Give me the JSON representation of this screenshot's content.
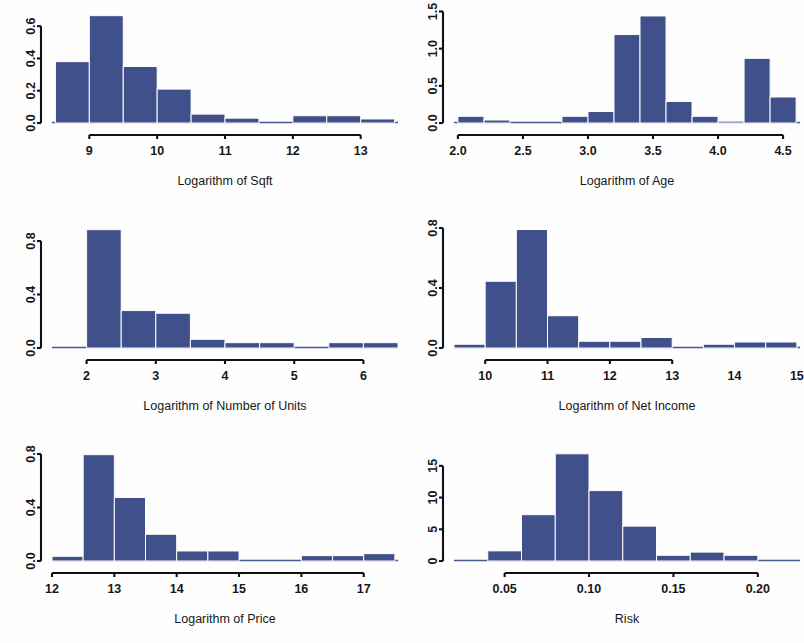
{
  "figure": {
    "background_color": "#fefefe",
    "bar_color": "#40508a",
    "axis_color": "#111111",
    "layout": "2 columns x 3 rows of histogram panels",
    "panel_count": 6
  },
  "chart_data": [
    {
      "id": "log-sqft",
      "type": "bar",
      "subtype": "histogram",
      "title": "",
      "xlabel": "Logarithm of Sqft",
      "ylabel": "",
      "grid": false,
      "legend": null,
      "xlim": [
        8.45,
        13.55
      ],
      "ylim": [
        0.0,
        0.7
      ],
      "xticks": [
        9,
        10,
        11,
        12,
        13
      ],
      "xtick_labels": [
        "9",
        "10",
        "11",
        "12",
        "13"
      ],
      "yticks": [
        0.0,
        0.2,
        0.4,
        0.6
      ],
      "ytick_labels": [
        "0.0",
        "0.2",
        "0.4",
        "0.6"
      ],
      "axis_span_x": [
        9,
        13
      ],
      "bin_width": 0.5,
      "bin_edges": [
        8.5,
        9.0,
        9.5,
        10.0,
        10.5,
        11.0,
        11.5,
        12.0,
        12.5,
        13.0,
        13.5
      ],
      "bin_centers": [
        8.75,
        9.25,
        9.75,
        10.25,
        10.75,
        11.25,
        11.75,
        12.25,
        12.75,
        13.25
      ],
      "values": [
        0.38,
        0.665,
        0.35,
        0.21,
        0.055,
        0.03,
        0.0,
        0.045,
        0.045,
        0.025
      ]
    },
    {
      "id": "log-age",
      "type": "bar",
      "subtype": "histogram",
      "title": "",
      "xlabel": "Logarithm of Age",
      "ylabel": "",
      "grid": false,
      "legend": null,
      "xlim": [
        1.97,
        4.63
      ],
      "ylim": [
        0.0,
        1.52
      ],
      "xticks": [
        2.0,
        2.5,
        3.0,
        3.5,
        4.0,
        4.5
      ],
      "xtick_labels": [
        "2.0",
        "2.5",
        "3.0",
        "3.5",
        "4.0",
        "4.5"
      ],
      "yticks": [
        0.0,
        0.5,
        1.0,
        1.5
      ],
      "ytick_labels": [
        "0.0",
        "0.5",
        "1.0",
        "1.5"
      ],
      "axis_span_x": [
        2.0,
        4.5
      ],
      "bin_width": 0.2,
      "bin_edges": [
        2.0,
        2.2,
        2.4,
        2.6,
        2.8,
        3.0,
        3.2,
        3.4,
        3.6,
        3.8,
        4.0,
        4.2,
        4.4,
        4.6
      ],
      "bin_centers": [
        2.1,
        2.3,
        2.5,
        2.7,
        2.9,
        3.1,
        3.3,
        3.5,
        3.7,
        3.9,
        4.1,
        4.3,
        4.5
      ],
      "values": [
        0.09,
        0.04,
        0.0,
        0.0,
        0.09,
        0.155,
        1.19,
        1.44,
        0.29,
        0.09,
        0.025,
        0.87,
        0.35
      ]
    },
    {
      "id": "log-units",
      "type": "bar",
      "subtype": "histogram",
      "title": "",
      "xlabel": "Logarithm of Number of Units",
      "ylabel": "",
      "grid": false,
      "legend": null,
      "xlim": [
        1.5,
        6.5
      ],
      "ylim": [
        0.0,
        0.92
      ],
      "xticks": [
        2,
        3,
        4,
        5,
        6
      ],
      "xtick_labels": [
        "2",
        "3",
        "4",
        "5",
        "6"
      ],
      "yticks": [
        0.0,
        0.4,
        0.8
      ],
      "ytick_labels": [
        "0.0",
        "0.4",
        "0.8"
      ],
      "axis_span_x": [
        2,
        6
      ],
      "bin_width": 0.5,
      "bin_edges": [
        1.5,
        2.0,
        2.5,
        3.0,
        3.5,
        4.0,
        4.5,
        5.0,
        5.5,
        6.0,
        6.5
      ],
      "bin_centers": [
        1.75,
        2.25,
        2.75,
        3.25,
        3.75,
        4.25,
        4.75,
        5.25,
        5.75,
        6.25
      ],
      "values": [
        0.0,
        0.885,
        0.28,
        0.26,
        0.065,
        0.04,
        0.04,
        0.0,
        0.04,
        0.04
      ]
    },
    {
      "id": "log-net-income",
      "type": "bar",
      "subtype": "histogram",
      "title": "",
      "xlabel": "Logarithm of Net Income",
      "ylabel": "",
      "grid": false,
      "legend": null,
      "xlim": [
        9.5,
        15.05
      ],
      "ylim": [
        0.0,
        0.82
      ],
      "xticks": [
        10,
        11,
        12,
        13,
        14,
        15
      ],
      "xtick_labels": [
        "10",
        "11",
        "12",
        "13",
        "14",
        "15"
      ],
      "yticks": [
        0.0,
        0.4,
        0.8
      ],
      "ytick_labels": [
        "0.0",
        "0.4",
        "0.8"
      ],
      "axis_span_x": [
        10,
        13
      ],
      "bin_width": 0.5,
      "bin_edges": [
        9.5,
        10.0,
        10.5,
        11.0,
        11.5,
        12.0,
        12.5,
        13.0,
        13.5,
        14.0,
        14.5,
        15.0
      ],
      "bin_centers": [
        9.75,
        10.25,
        10.75,
        11.25,
        11.75,
        12.25,
        12.75,
        13.25,
        13.75,
        14.25,
        14.75
      ],
      "values": [
        0.025,
        0.445,
        0.79,
        0.215,
        0.045,
        0.045,
        0.07,
        0.0,
        0.025,
        0.04,
        0.04
      ]
    },
    {
      "id": "log-price",
      "type": "bar",
      "subtype": "histogram",
      "title": "",
      "xlabel": "Logarithm of Price",
      "ylabel": "",
      "grid": false,
      "legend": null,
      "xlim": [
        12.0,
        17.55
      ],
      "ylim": [
        0.0,
        0.83
      ],
      "xticks": [
        12,
        13,
        14,
        15,
        16,
        17
      ],
      "xtick_labels": [
        "12",
        "13",
        "14",
        "15",
        "16",
        "17"
      ],
      "yticks": [
        0.0,
        0.4,
        0.8
      ],
      "ytick_labels": [
        "0.0",
        "0.4",
        "0.8"
      ],
      "axis_span_x": [
        12,
        17
      ],
      "bin_width": 0.5,
      "bin_edges": [
        12.0,
        12.5,
        13.0,
        13.5,
        14.0,
        14.5,
        15.0,
        15.5,
        16.0,
        16.5,
        17.0,
        17.5
      ],
      "bin_centers": [
        12.25,
        12.75,
        13.25,
        13.75,
        14.25,
        14.75,
        15.25,
        15.75,
        16.25,
        16.75,
        17.25
      ],
      "values": [
        0.035,
        0.795,
        0.475,
        0.2,
        0.075,
        0.075,
        0.0,
        0.0,
        0.04,
        0.04,
        0.055
      ]
    },
    {
      "id": "risk",
      "type": "bar",
      "subtype": "histogram",
      "title": "",
      "xlabel": "Risk",
      "ylabel": "",
      "grid": false,
      "legend": null,
      "xlim": [
        0.02,
        0.225
      ],
      "ylim": [
        0,
        17.5
      ],
      "xticks": [
        0.05,
        0.1,
        0.15,
        0.2
      ],
      "xtick_labels": [
        "0.05",
        "0.10",
        "0.15",
        "0.20"
      ],
      "yticks": [
        0,
        5,
        10,
        15
      ],
      "ytick_labels": [
        "0",
        "5",
        "10",
        "15"
      ],
      "axis_span_x": [
        0.05,
        0.2
      ],
      "bin_width": 0.02,
      "bin_edges": [
        0.02,
        0.04,
        0.06,
        0.08,
        0.1,
        0.12,
        0.14,
        0.16,
        0.18,
        0.2,
        0.22
      ],
      "bin_centers": [
        0.03,
        0.05,
        0.07,
        0.09,
        0.11,
        0.13,
        0.15,
        0.17,
        0.19,
        0.21
      ],
      "values": [
        0.0,
        1.6,
        7.3,
        16.9,
        11.1,
        5.5,
        0.9,
        1.4,
        0.9,
        0.0
      ]
    }
  ]
}
